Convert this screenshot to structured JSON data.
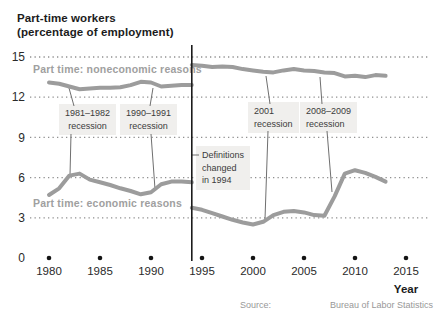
{
  "title": {
    "line1": "Part-time workers",
    "line2": "(percentage of employment)"
  },
  "series_labels": {
    "noneconomic": "Part time: noneconomic reasons",
    "economic": "Part time: economic reasons"
  },
  "annotations": {
    "recessions": [
      {
        "line1": "1981–1982",
        "line2": "recession"
      },
      {
        "line1": "1990–1991",
        "line2": "recession"
      },
      {
        "line1": "2001",
        "line2": "recession"
      },
      {
        "line1": "2008–2009",
        "line2": "recession"
      }
    ],
    "definitions": {
      "line1": "Definitions",
      "line2": "changed",
      "line3": "in 1994"
    }
  },
  "axis": {
    "y_ticks": [
      "15",
      "12",
      "9",
      "6",
      "3",
      "0"
    ],
    "x_ticks": [
      "1980",
      "1985",
      "1990",
      "1995",
      "2000",
      "2005",
      "2010",
      "2015"
    ],
    "x_title": "Year"
  },
  "source": {
    "left": "Source:",
    "right": "Bureau of Labor Statistics"
  },
  "colors": {
    "line_gray": "#9c9c9c",
    "grid_dot": "#909090",
    "axis_black": "#1c1c1c",
    "callout": "#6f6f6f",
    "box_bg": "#f0efed",
    "dot_black": "#141414"
  },
  "chart_data": {
    "type": "line",
    "title": "Part-time workers (percentage of employment)",
    "xlabel": "Year",
    "ylabel": "percentage of employment",
    "x_range": [
      1980,
      2015
    ],
    "ylim": [
      0,
      15
    ],
    "y_ticks": [
      0,
      3,
      6,
      9,
      12,
      15
    ],
    "x_ticks": [
      1980,
      1985,
      1990,
      1995,
      2000,
      2005,
      2010,
      2015
    ],
    "grid": "horizontal dotted",
    "break_note": "Definitions changed in 1994 (vertical line marks series break)",
    "series": [
      {
        "name": "Part time: noneconomic reasons",
        "segments": [
          {
            "x": [
              1980,
              1981,
              1982,
              1983,
              1984,
              1985,
              1986,
              1987,
              1988,
              1989,
              1990,
              1991,
              1992,
              1993,
              1994
            ],
            "y": [
              13.1,
              13.0,
              12.8,
              12.6,
              12.65,
              12.7,
              12.7,
              12.75,
              12.9,
              13.15,
              13.1,
              12.8,
              12.85,
              12.9,
              12.9
            ]
          },
          {
            "x": [
              1994,
              1995,
              1996,
              1997,
              1998,
              1999,
              2000,
              2001,
              2002,
              2003,
              2004,
              2005,
              2006,
              2007,
              2008,
              2009,
              2010,
              2011,
              2012,
              2013
            ],
            "y": [
              14.4,
              14.35,
              14.25,
              14.3,
              14.25,
              14.1,
              14.0,
              13.9,
              13.85,
              14.0,
              14.1,
              14.0,
              13.95,
              13.85,
              13.8,
              13.55,
              13.6,
              13.5,
              13.65,
              13.6
            ]
          }
        ]
      },
      {
        "name": "Part time: economic reasons",
        "segments": [
          {
            "x": [
              1980,
              1981,
              1982,
              1983,
              1984,
              1985,
              1986,
              1987,
              1988,
              1989,
              1990,
              1991,
              1992,
              1993,
              1994
            ],
            "y": [
              4.7,
              5.2,
              6.15,
              6.3,
              5.85,
              5.65,
              5.45,
              5.2,
              5.0,
              4.75,
              4.9,
              5.5,
              5.7,
              5.7,
              5.65
            ]
          },
          {
            "x": [
              1994,
              1995,
              1996,
              1997,
              1998,
              1999,
              2000,
              2001,
              2002,
              2003,
              2004,
              2005,
              2006,
              2007,
              2008,
              2009,
              2010,
              2011,
              2012,
              2013
            ],
            "y": [
              3.75,
              3.6,
              3.35,
              3.1,
              2.85,
              2.65,
              2.5,
              2.7,
              3.2,
              3.45,
              3.5,
              3.4,
              3.2,
              3.15,
              4.6,
              6.3,
              6.55,
              6.35,
              6.05,
              5.7
            ]
          }
        ]
      }
    ]
  }
}
